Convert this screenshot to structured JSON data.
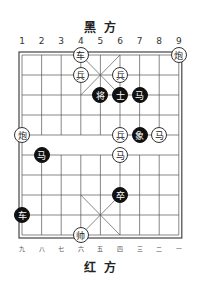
{
  "title_top": "黑方",
  "title_bottom": "红方",
  "top_numbers": [
    "1",
    "2",
    "3",
    "4",
    "5",
    "6",
    "7",
    "8",
    "9"
  ],
  "bottom_numbers": [
    "九",
    "八",
    "七",
    "六",
    "五",
    "四",
    "三",
    "二",
    "一"
  ],
  "pieces": [
    {
      "side": "red",
      "char": "车",
      "col": 4,
      "row": 0
    },
    {
      "side": "red",
      "char": "炮",
      "col": 9,
      "row": 0
    },
    {
      "side": "red",
      "char": "兵",
      "col": 4,
      "row": 1
    },
    {
      "side": "red",
      "char": "兵",
      "col": 6,
      "row": 1
    },
    {
      "side": "black",
      "char": "将",
      "col": 5,
      "row": 2
    },
    {
      "side": "black",
      "char": "士",
      "col": 6,
      "row": 2
    },
    {
      "side": "black",
      "char": "马",
      "col": 7,
      "row": 2
    },
    {
      "side": "red",
      "char": "炮",
      "col": 1,
      "row": 4
    },
    {
      "side": "red",
      "char": "兵",
      "col": 6,
      "row": 4
    },
    {
      "side": "black",
      "char": "象",
      "col": 7,
      "row": 4
    },
    {
      "side": "red",
      "char": "马",
      "col": 8,
      "row": 4
    },
    {
      "side": "black",
      "char": "马",
      "col": 2,
      "row": 5
    },
    {
      "side": "red",
      "char": "马",
      "col": 6,
      "row": 5
    },
    {
      "side": "black",
      "char": "卒",
      "col": 6,
      "row": 7
    },
    {
      "side": "black",
      "char": "车",
      "col": 1,
      "row": 8
    },
    {
      "side": "red",
      "char": "帅",
      "col": 4,
      "row": 9
    }
  ]
}
